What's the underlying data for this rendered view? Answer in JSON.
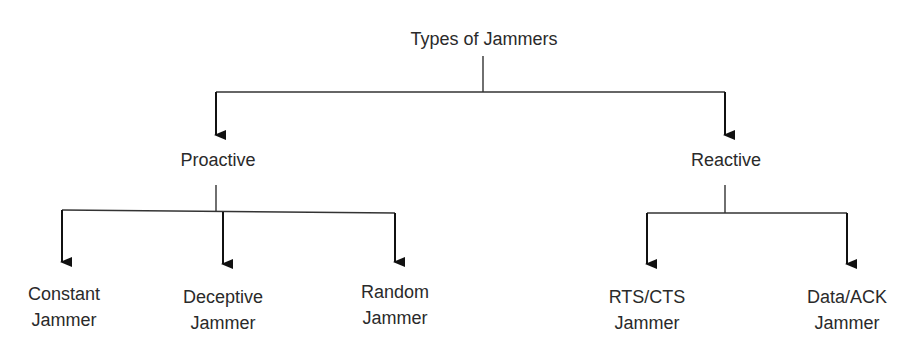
{
  "diagram": {
    "title": "Types of Jammers",
    "root": {
      "label": "Types of Jammers"
    },
    "categories": [
      {
        "label": "Proactive",
        "children": [
          {
            "line1": "Constant",
            "line2": "Jammer"
          },
          {
            "line1": "Deceptive",
            "line2": "Jammer"
          },
          {
            "line1": "Random",
            "line2": "Jammer"
          }
        ]
      },
      {
        "label": "Reactive",
        "children": [
          {
            "line1": "RTS/CTS",
            "line2": "Jammer"
          },
          {
            "line1": "Data/ACK",
            "line2": "Jammer"
          }
        ]
      }
    ],
    "line_color": "#222222"
  }
}
